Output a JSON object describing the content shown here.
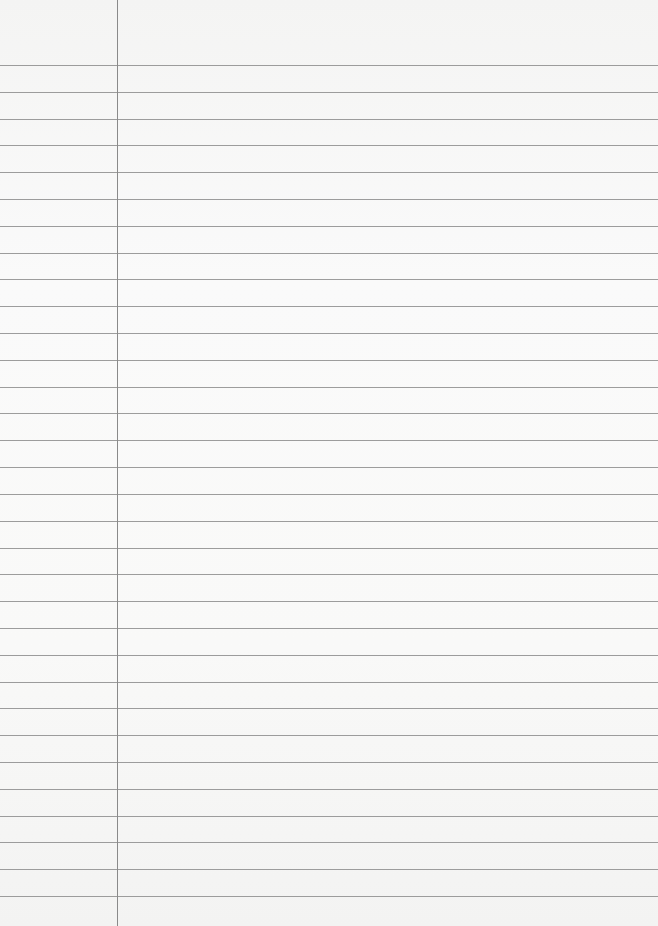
{
  "page": {
    "type": "lined paper",
    "rule_count": 32,
    "has_margin_line": true,
    "text_content": ""
  },
  "colors": {
    "paper": "#f7f7f6",
    "rule": "#8c8c8c",
    "margin": "#8a8a8a"
  }
}
